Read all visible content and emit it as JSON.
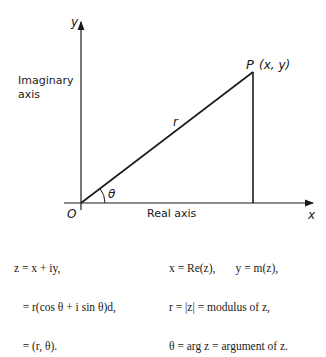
{
  "diagram": {
    "y_axis_label": "y",
    "x_axis_label": "x",
    "imaginary_axis_label_line1": "Imaginary",
    "imaginary_axis_label_line2": "axis",
    "real_axis_label": "Real axis",
    "origin_label": "O",
    "point_label": "P",
    "point_coords_label": "(x, y)",
    "radius_label": "r",
    "angle_label": "θ"
  },
  "equations": {
    "left": [
      "z = x + iy,",
      "   = r(cos θ + i sin θ)d,",
      "   = (r, θ)."
    ],
    "right": [
      "x = Re(z),       y = m(z),",
      "r = |z| = modulus of z,",
      "θ = arg z = argument of z."
    ]
  }
}
